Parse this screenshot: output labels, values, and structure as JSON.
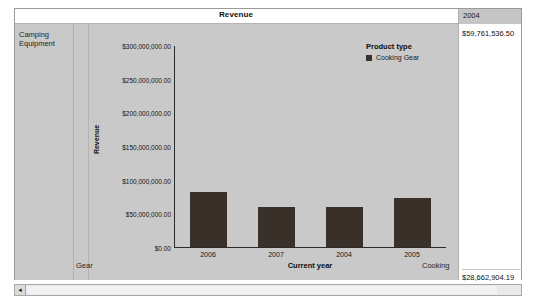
{
  "report": {
    "measure_title": "Revenue",
    "row_header_label": "Camping Equipment",
    "row_header_bottom_label": "Gear",
    "column_header": "2004",
    "value_top": "$59,761,536.50",
    "value_bottom": "$28,662,904.19",
    "chart_bottom_right_label": "Cooking"
  },
  "chart_data": {
    "type": "bar",
    "title": "",
    "categories": [
      "2006",
      "2007",
      "2004",
      "2005"
    ],
    "values": [
      82000000,
      59000000,
      59761536.5,
      73000000
    ],
    "series": [
      {
        "name": "Cooking Gear",
        "values": [
          82000000,
          59000000,
          59761536.5,
          73000000
        ]
      }
    ],
    "xlabel": "Current year",
    "ylabel": "Revenue",
    "ylim": [
      0,
      300000000
    ],
    "y_ticks": [
      0,
      50000000,
      100000000,
      150000000,
      200000000,
      250000000,
      300000000
    ],
    "y_tick_labels": [
      "$0.00",
      "$50,000,000.00",
      "$100,000,000.00",
      "$150,000,000.00",
      "$200,000,000.00",
      "$250,000,000.00",
      "$300,000,000.00"
    ],
    "grid": false,
    "legend_position": "top-right",
    "legend_title": "Product type",
    "legend_entries": [
      "Cooking Gear"
    ],
    "bar_color": "#3a302a",
    "plot_background": "#c9c9c9"
  },
  "scrollbar": {
    "left_arrow": "◄"
  }
}
